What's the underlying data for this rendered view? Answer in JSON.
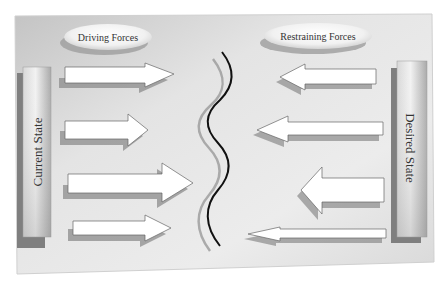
{
  "diagram": {
    "type": "force-field-analysis",
    "headers": {
      "driving": "Driving Forces",
      "restraining": "Restraining Forces"
    },
    "states": {
      "current": "Current State",
      "desired": "Desired State"
    },
    "driving_forces": [
      {
        "direction": "right",
        "strength": "medium"
      },
      {
        "direction": "right",
        "strength": "medium"
      },
      {
        "direction": "right",
        "strength": "strong"
      },
      {
        "direction": "right",
        "strength": "weak"
      }
    ],
    "restraining_forces": [
      {
        "direction": "left",
        "strength": "medium"
      },
      {
        "direction": "left",
        "strength": "medium"
      },
      {
        "direction": "left",
        "strength": "strong"
      },
      {
        "direction": "left",
        "strength": "weak"
      }
    ],
    "divider": "wavy-line",
    "colors": {
      "panel_light": "#eeeeee",
      "panel_dark": "#bdbdbd",
      "arrow_fill": "#ffffff",
      "arrow_shadow": "#8c8c8c",
      "bar_shadow": "#7a7a7a",
      "line": "#111111"
    }
  }
}
